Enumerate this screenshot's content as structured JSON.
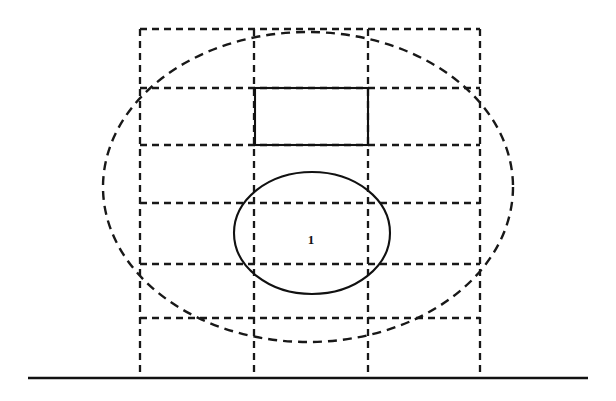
{
  "figure": {
    "background_color": "#ffffff",
    "stroke_color": "#181818",
    "solid_stroke_color": "#111111",
    "width": 616,
    "height": 401,
    "labels": [
      {
        "text": "1",
        "x": 311,
        "y": 244
      }
    ],
    "grid": {
      "name": "dashed-grid",
      "vertical_lines": [
        {
          "x": 140,
          "y1": 29,
          "y2": 378
        },
        {
          "x": 254,
          "y1": 29,
          "y2": 378
        },
        {
          "x": 368,
          "y1": 29,
          "y2": 378
        },
        {
          "x": 480,
          "y1": 29,
          "y2": 378
        }
      ],
      "horizontal_lines": [
        {
          "y": 29,
          "x1": 140,
          "x2": 480
        },
        {
          "y": 88,
          "x1": 140,
          "x2": 480
        },
        {
          "y": 145,
          "x1": 140,
          "x2": 480
        },
        {
          "y": 203,
          "x1": 140,
          "x2": 480
        },
        {
          "y": 264,
          "x1": 140,
          "x2": 480
        },
        {
          "y": 318,
          "x1": 140,
          "x2": 480
        }
      ]
    },
    "outer_ellipse": {
      "name": "dashed-outer-ellipse",
      "cx": 308,
      "cy": 187,
      "rx": 205,
      "ry": 155
    },
    "inner_ellipse": {
      "name": "solid-inner-ellipse",
      "cx": 312,
      "cy": 233,
      "rx": 78,
      "ry": 61
    },
    "solid_rectangle": {
      "name": "solid-rectangle",
      "x": 255,
      "y": 88,
      "width": 113,
      "height": 57
    },
    "ground_line": {
      "name": "ground-line",
      "x1": 28,
      "y1": 378,
      "x2": 588,
      "y2": 378
    }
  }
}
